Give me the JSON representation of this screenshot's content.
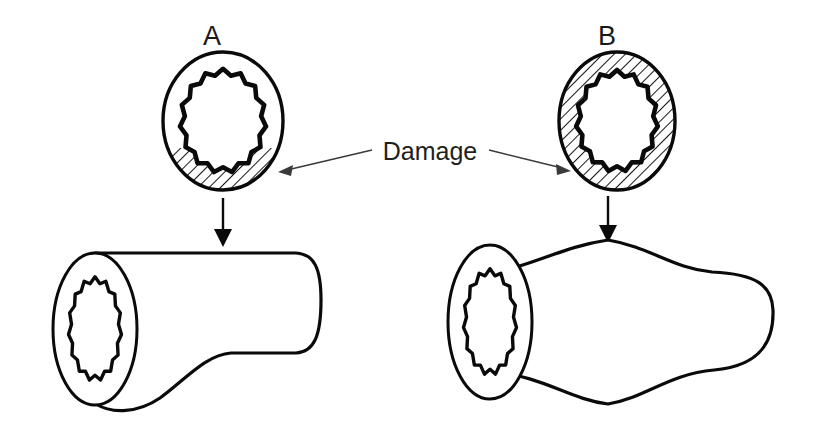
{
  "figure": {
    "background_color": "#ffffff",
    "ink_color": "#0a0a0a",
    "leader_color": "#3a3a3a",
    "width": 820,
    "height": 431
  },
  "callout": {
    "label": "Damage",
    "x": 430,
    "y": 160
  },
  "panels": [
    {
      "id": "A",
      "letter": "A",
      "letter_x": 212,
      "letter_y": 45,
      "cross_section": {
        "name": "eccentric-wall-damage",
        "center_x": 223,
        "center_y": 121,
        "outer_rx": 60,
        "outer_ry": 69,
        "lumen_rx": 39,
        "lumen_ry": 47,
        "teeth": 15,
        "damage_extent": "focal",
        "damage_description": "hatched segment confined to the lower wall",
        "hatch_angle_deg": 45
      },
      "vessel": {
        "name": "saccular-aneurysm",
        "shape": "asymmetric-outpouching",
        "bulge_side": "inferior",
        "left_x": 52,
        "right_x": 320,
        "top_y": 253,
        "base_bottom_y": 355,
        "bulge_peak_y": 412
      },
      "arrow": {
        "x": 223,
        "y_start": 198,
        "y_end": 243
      }
    },
    {
      "id": "B",
      "letter": "B",
      "letter_x": 607,
      "letter_y": 45,
      "cross_section": {
        "name": "circumferential-wall-damage",
        "center_x": 617,
        "center_y": 121,
        "outer_rx": 58,
        "outer_ry": 69,
        "lumen_rx": 37,
        "lumen_ry": 46,
        "teeth": 15,
        "damage_extent": "circumferential",
        "damage_description": "entire annular wall hatched",
        "hatch_angle_deg": 45
      },
      "vessel": {
        "name": "fusiform-aneurysm",
        "shape": "symmetric-spindle",
        "bulge_side": "both",
        "left_x": 447,
        "right_x": 790,
        "top_y": 270,
        "bulge_peak_top_y": 238,
        "base_bottom_y": 372,
        "bulge_peak_bottom_y": 405
      },
      "arrow": {
        "x": 608,
        "y_start": 196,
        "y_end": 241
      }
    }
  ],
  "leaders": [
    {
      "name": "leader-to-panel-a",
      "from_x": 372,
      "from_y": 150,
      "to_x": 281,
      "to_y": 172,
      "points_to": "A"
    },
    {
      "name": "leader-to-panel-b",
      "from_x": 489,
      "from_y": 150,
      "to_x": 568,
      "to_y": 171,
      "points_to": "B"
    }
  ]
}
